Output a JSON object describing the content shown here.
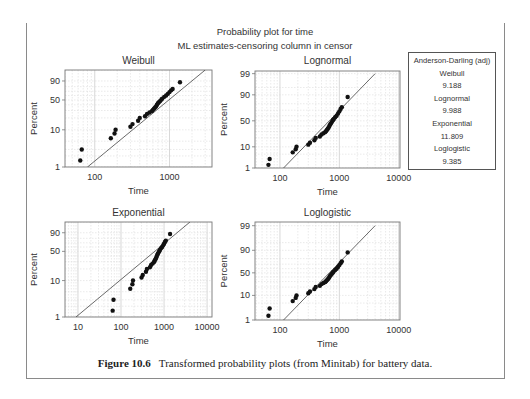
{
  "figure": {
    "title": "Probability plot for time",
    "subtitle": "ML estimates-censoring column in censor",
    "caption_label": "Figure 10.6",
    "caption_text": "Transformed probability plots (from Minitab) for battery data."
  },
  "legend_box": {
    "heading": "Anderson-Darling (adj)",
    "entries": [
      {
        "name": "Weibull",
        "value": "9.188"
      },
      {
        "name": "Lognormal",
        "value": "9.988"
      },
      {
        "name": "Exponential",
        "value": "11.809"
      },
      {
        "name": "Loglogistic",
        "value": "9.385"
      }
    ]
  },
  "chart_data": [
    {
      "type": "scatter",
      "title": "Weibull",
      "xlabel": "Time",
      "ylabel": "Percent",
      "xscale": "log",
      "xlim": [
        40,
        3700
      ],
      "xticks": [
        100,
        1000
      ],
      "xticklabels": [
        "100",
        "1000"
      ],
      "yticks": [
        1,
        10,
        50,
        90
      ],
      "yticklabels": [
        "1",
        "10",
        "50",
        "90"
      ],
      "ylim": [
        1,
        99
      ],
      "grid": true,
      "fit_line": {
        "x": [
          80,
          3000
        ],
        "y": [
          1,
          99
        ]
      },
      "points": {
        "time": [
          64,
          67,
          164,
          184,
          190,
          300,
          320,
          380,
          400,
          470,
          500,
          540,
          580,
          600,
          620,
          640,
          660,
          680,
          700,
          720,
          750,
          780,
          800,
          850,
          900,
          950,
          1000,
          1050,
          1100,
          1380
        ],
        "percent": [
          1.5,
          3,
          6,
          8,
          10,
          12,
          14,
          17,
          20,
          22,
          25,
          27,
          29,
          31,
          33,
          35,
          37,
          40,
          43,
          45,
          48,
          51,
          53,
          57,
          60,
          64,
          68,
          72,
          75,
          88
        ]
      }
    },
    {
      "type": "scatter",
      "title": "Lognormal",
      "xlabel": "Time",
      "ylabel": "Percent",
      "xscale": "log",
      "xlim": [
        38,
        10500
      ],
      "xticks": [
        100,
        1000,
        10000
      ],
      "xticklabels": [
        "100",
        "1000",
        "10000"
      ],
      "yticks": [
        1,
        10,
        50,
        90,
        99
      ],
      "yticklabels": [
        "1",
        "10",
        "50",
        "90",
        "99"
      ],
      "ylim": [
        1,
        99
      ],
      "grid": true,
      "fit_line": {
        "x": [
          115,
          4000
        ],
        "y": [
          1,
          99
        ]
      },
      "points": {
        "time": [
          64,
          67,
          164,
          184,
          190,
          300,
          320,
          380,
          400,
          470,
          500,
          540,
          580,
          600,
          620,
          640,
          660,
          680,
          700,
          720,
          750,
          780,
          800,
          850,
          900,
          950,
          1000,
          1050,
          1100,
          1380
        ],
        "percent": [
          1.5,
          3,
          6,
          8,
          10,
          12,
          14,
          17,
          20,
          22,
          25,
          27,
          29,
          31,
          33,
          35,
          37,
          40,
          43,
          45,
          48,
          51,
          53,
          57,
          60,
          64,
          68,
          72,
          75,
          88
        ]
      }
    },
    {
      "type": "scatter",
      "title": "Exponential",
      "xlabel": "Time",
      "ylabel": "Percent",
      "xscale": "log",
      "xlim": [
        5,
        13000
      ],
      "xticks": [
        10,
        100,
        1000,
        10000
      ],
      "xticklabels": [
        "10",
        "100",
        "1000",
        "10000"
      ],
      "yticks": [
        1,
        10,
        50,
        90
      ],
      "yticklabels": [
        "1",
        "10",
        "50",
        "90"
      ],
      "ylim": [
        1,
        99
      ],
      "grid": true,
      "fit_line": {
        "x": [
          9,
          4000
        ],
        "y": [
          1,
          99
        ]
      },
      "points": {
        "time": [
          64,
          67,
          164,
          184,
          190,
          300,
          320,
          380,
          400,
          470,
          500,
          540,
          580,
          600,
          620,
          640,
          660,
          680,
          700,
          720,
          750,
          780,
          800,
          850,
          900,
          950,
          1000,
          1050,
          1100,
          1380
        ],
        "percent": [
          1.5,
          3,
          6,
          8,
          10,
          12,
          14,
          17,
          20,
          22,
          25,
          27,
          29,
          31,
          33,
          35,
          37,
          40,
          43,
          45,
          48,
          51,
          53,
          57,
          60,
          64,
          68,
          72,
          75,
          88
        ]
      }
    },
    {
      "type": "scatter",
      "title": "Loglogistic",
      "xlabel": "Time",
      "ylabel": "Percent",
      "xscale": "log",
      "xlim": [
        38,
        10500
      ],
      "xticks": [
        100,
        1000,
        10000
      ],
      "xticklabels": [
        "100",
        "1000",
        "10000"
      ],
      "yticks": [
        1,
        10,
        50,
        90,
        99
      ],
      "yticklabels": [
        "1",
        "10",
        "50",
        "90",
        "99"
      ],
      "ylim": [
        1,
        99
      ],
      "grid": true,
      "fit_line": {
        "x": [
          115,
          4000
        ],
        "y": [
          1,
          99
        ]
      },
      "points": {
        "time": [
          64,
          67,
          164,
          184,
          190,
          300,
          320,
          380,
          400,
          470,
          500,
          540,
          580,
          600,
          620,
          640,
          660,
          680,
          700,
          720,
          750,
          780,
          800,
          850,
          900,
          950,
          1000,
          1050,
          1100,
          1380
        ],
        "percent": [
          1.5,
          3,
          6,
          8,
          10,
          12,
          14,
          17,
          20,
          22,
          25,
          27,
          29,
          31,
          33,
          35,
          37,
          40,
          43,
          45,
          48,
          51,
          53,
          57,
          60,
          64,
          68,
          72,
          75,
          88
        ]
      }
    }
  ]
}
